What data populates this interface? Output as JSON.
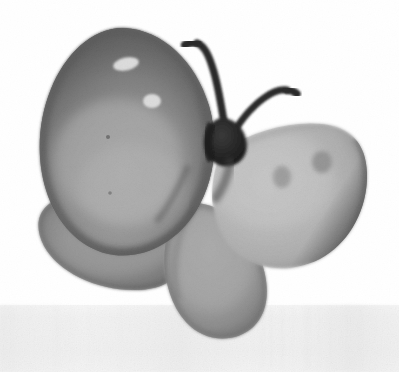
{
  "image": {
    "title": "Butterfly",
    "subject": "butterfly",
    "medium": "grayscale watercolor / painted illustration",
    "style": "soft-edged monochrome wash on paper with visible canvas texture",
    "orientation": "three-quarter view, facing upper-left",
    "canvas": {
      "width": 399,
      "height": 372,
      "background_color": "#ffffff"
    }
  },
  "palette": {
    "background": "#ffffff",
    "paper_band": "#f4f4f4",
    "paper_band_texture": "#ececec",
    "wing_dark_edge": "#3a3a3a",
    "wing_mid_dark": "#6e6e6e",
    "wing_upper_left_center": "#a8a8a8",
    "wing_lower_left": "#8f8f8f",
    "wing_right_base": "#bdbdbd",
    "wing_right_light": "#cfcfcf",
    "wing_lower_center": "#a5a5a5",
    "wing_spot_gray": "#8a8a8a",
    "highlight_white": "#fdfdfd",
    "body_dark": "#262626",
    "antenna_dark": "#2b2b2b"
  },
  "parts": [
    {
      "id": "wing-upper-left",
      "label": "Upper left forewing",
      "description": "Large rounded teardrop wing tilted up-left, dark charcoal rim fading to a pale gray interior, bearing two white highlight spots.",
      "fill_center": "#a8a8a8",
      "fill_edge": "#3a3a3a",
      "bbox": [
        40,
        28,
        215,
        230
      ]
    },
    {
      "id": "wing-lower-left",
      "label": "Lower left hindwing",
      "description": "Rounded lobe below the upper left wing, uniform medium gray with a soft dark outline.",
      "fill_center": "#8f8f8f",
      "fill_edge": "#5a5a5a",
      "bbox": [
        38,
        192,
        190,
        290
      ]
    },
    {
      "id": "wing-right",
      "label": "Right forewing",
      "description": "Broad pale gray wing sweeping to the right, darker along the outer right rim, with two soft gray spots near the top.",
      "fill_center": "#bdbdbd",
      "fill_edge": "#4a4a4a",
      "bbox": [
        215,
        122,
        368,
        270
      ]
    },
    {
      "id": "wing-lower-center",
      "label": "Lower center hindwing",
      "description": "Drooping teardrop lobe hanging down from the body centre, medium gray with a soft dark rim.",
      "fill_center": "#a5a5a5",
      "fill_edge": "#5f5f5f",
      "bbox": [
        160,
        200,
        275,
        340
      ]
    },
    {
      "id": "body",
      "label": "Body / thorax",
      "description": "Small dark charcoal wedge at the meeting point of all four wings.",
      "fill_center": "#262626",
      "bbox": [
        205,
        118,
        250,
        165
      ]
    },
    {
      "id": "antenna-left",
      "label": "Left antenna",
      "description": "Dark stroke rising from the body and curving up and to the left, ending in a blunt clubbed tip.",
      "fill_center": "#2b2b2b",
      "tip": [
        197,
        42
      ]
    },
    {
      "id": "antenna-right",
      "label": "Right antenna",
      "description": "Dark stroke rising from the body and arcing up and to the right, ending in a blunt clubbed tip.",
      "fill_center": "#2b2b2b",
      "tip": [
        287,
        90
      ]
    }
  ],
  "markings": [
    {
      "id": "highlight-spot-upper",
      "label": "Upper white highlight spot",
      "on": "wing-upper-left",
      "color": "#fdfdfd",
      "center": [
        126,
        64
      ],
      "size": [
        26,
        13
      ]
    },
    {
      "id": "highlight-spot-lower",
      "label": "Lower white highlight spot",
      "on": "wing-upper-left",
      "color": "#fdfdfd",
      "center": [
        152,
        101
      ],
      "size": [
        18,
        14
      ]
    },
    {
      "id": "wing-spot-inner",
      "label": "Inner gray wing spot",
      "on": "wing-right",
      "color": "#8a8a8a",
      "center": [
        282,
        177
      ],
      "size": [
        17,
        21
      ]
    },
    {
      "id": "wing-spot-outer",
      "label": "Outer gray wing spot",
      "on": "wing-right",
      "color": "#7f7f7f",
      "center": [
        322,
        162
      ],
      "size": [
        20,
        22
      ]
    }
  ],
  "background": {
    "paper_band": {
      "label": "Lower paper band",
      "description": "Faint light gray horizontal band across the lower portion of the sheet with subtle vertical streak texture.",
      "top_y": 307,
      "color": "#f4f4f4"
    }
  }
}
